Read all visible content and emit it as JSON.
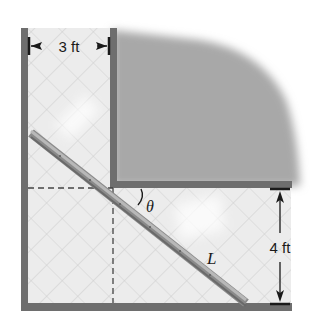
{
  "diagram": {
    "type": "ladder-around-corner",
    "labels": {
      "vertical_hall_width": "3 ft",
      "horizontal_hall_width": "4 ft",
      "angle": "θ",
      "ladder": "L"
    },
    "colors": {
      "wall": "#6e6e6e",
      "floor": "#ececec",
      "floor_grid": "#d2d2d2",
      "blob": "#a9a9a9",
      "ladder_dark": "#7d7d7d",
      "ladder_light": "#b5b5b5",
      "dimension": "#1a1a1a",
      "dashed": "#444444"
    }
  }
}
